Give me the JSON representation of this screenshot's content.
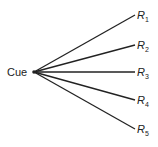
{
  "diagram": {
    "source_label": "Cue",
    "origin": {
      "x": 34,
      "y": 72
    },
    "responses": [
      {
        "label": "R",
        "subscript": "1",
        "end": {
          "x": 135,
          "y": 15
        }
      },
      {
        "label": "R",
        "subscript": "2",
        "end": {
          "x": 135,
          "y": 45
        }
      },
      {
        "label": "R",
        "subscript": "3",
        "end": {
          "x": 135,
          "y": 72
        }
      },
      {
        "label": "R",
        "subscript": "4",
        "end": {
          "x": 135,
          "y": 100
        }
      },
      {
        "label": "R",
        "subscript": "5",
        "end": {
          "x": 135,
          "y": 129
        }
      }
    ],
    "line_color": "#222222"
  }
}
